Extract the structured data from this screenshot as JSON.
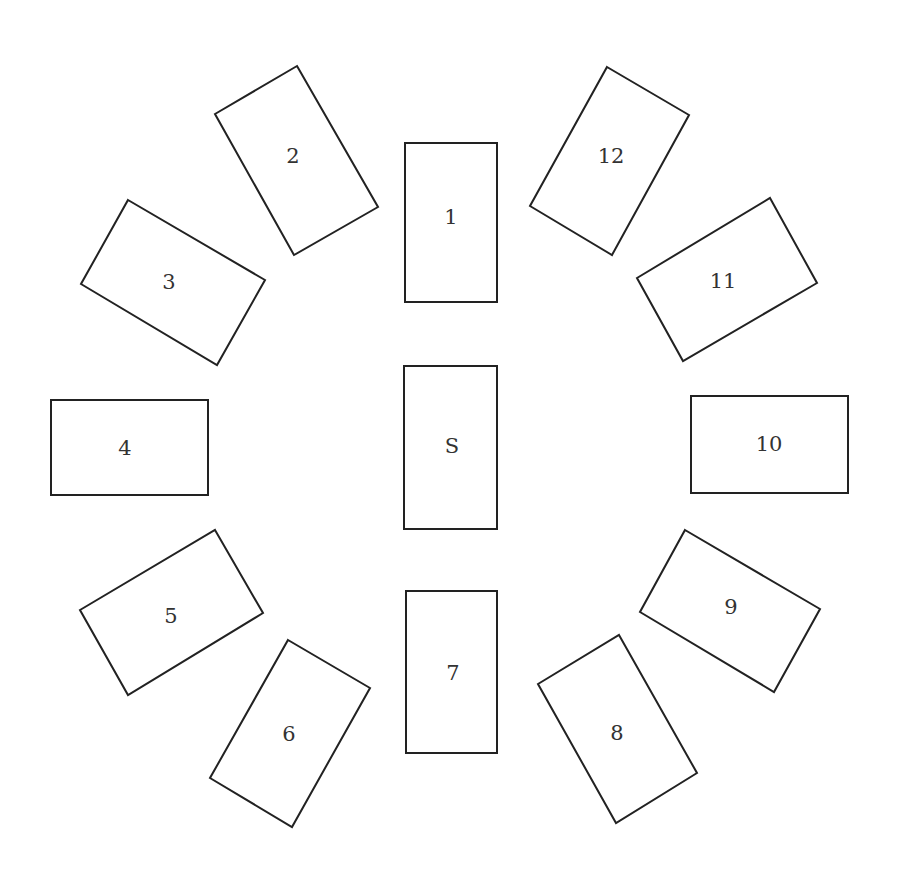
{
  "diagram": {
    "type": "card-spread",
    "stroke_color": "#222222",
    "label_color": "#333333",
    "cards": [
      {
        "label": "1",
        "points": "405,143 497,143 497,302 405,302",
        "cx": 451,
        "cy": 218
      },
      {
        "label": "2",
        "points": "297,66 378,207 294,255 215,114",
        "cx": 293,
        "cy": 157
      },
      {
        "label": "3",
        "points": "128,200 265,280 217,365 81,284",
        "cx": 169,
        "cy": 283
      },
      {
        "label": "4",
        "points": "51,400 208,400 208,495 51,495",
        "cx": 125,
        "cy": 449
      },
      {
        "label": "5",
        "points": "215,530 263,613 128,695 80,610",
        "cx": 171,
        "cy": 617
      },
      {
        "label": "6",
        "points": "288,640 370,688 292,827 210,778",
        "cx": 289,
        "cy": 735
      },
      {
        "label": "7",
        "points": "406,591 497,591 497,753 406,753",
        "cx": 453,
        "cy": 674
      },
      {
        "label": "8",
        "points": "619,635 697,773 616,823 538,684",
        "cx": 617,
        "cy": 734
      },
      {
        "label": "9",
        "points": "685,530 820,609 774,692 640,612",
        "cx": 731,
        "cy": 608
      },
      {
        "label": "10",
        "points": "691,396 848,396 848,493 691,493",
        "cx": 769,
        "cy": 445
      },
      {
        "label": "11",
        "points": "770,198 817,283 683,361 637,278",
        "cx": 723,
        "cy": 282
      },
      {
        "label": "12",
        "points": "607,67 689,115 612,255 530,206",
        "cx": 611,
        "cy": 157
      },
      {
        "label": "S",
        "points": "404,366 497,366 497,529 404,529",
        "cx": 452,
        "cy": 447
      }
    ]
  }
}
